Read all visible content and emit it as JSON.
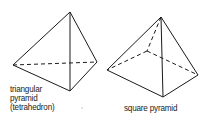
{
  "figures": [
    {
      "name": "triangular-pyramid",
      "label_lines": [
        "triangular",
        "pyramid",
        "(tetrahedron)"
      ],
      "vertices": {
        "apex": [
          70,
          12
        ],
        "left": [
          13,
          65
        ],
        "right": [
          97,
          62
        ],
        "front": [
          70,
          91
        ]
      },
      "solid_edges": [
        [
          "apex",
          "left"
        ],
        [
          "apex",
          "right"
        ],
        [
          "apex",
          "front"
        ],
        [
          "left",
          "front"
        ],
        [
          "front",
          "right"
        ]
      ],
      "dashed_edges": [
        [
          "left",
          "right"
        ]
      ]
    },
    {
      "name": "square-pyramid",
      "label_lines": [
        "square pyramid"
      ],
      "vertices": {
        "apex": [
          161,
          17
        ],
        "left": [
          107,
          70
        ],
        "front": [
          163,
          97
        ],
        "right": [
          198,
          75
        ],
        "back": [
          147,
          51
        ]
      },
      "solid_edges": [
        [
          "apex",
          "left"
        ],
        [
          "apex",
          "front"
        ],
        [
          "apex",
          "right"
        ],
        [
          "left",
          "front"
        ],
        [
          "front",
          "right"
        ]
      ],
      "dashed_edges": [
        [
          "apex",
          "back"
        ],
        [
          "back",
          "left"
        ],
        [
          "back",
          "right"
        ]
      ]
    }
  ],
  "colors": {
    "stroke": "#1a1a1a",
    "background": "#ffffff"
  }
}
